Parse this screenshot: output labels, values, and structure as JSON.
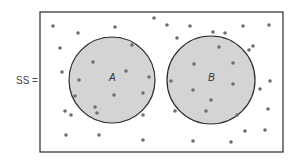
{
  "label": "SS =",
  "sets": [
    {
      "name": "A",
      "cx": 112,
      "cy": 80,
      "r": 43
    },
    {
      "name": "B",
      "cx": 211,
      "cy": 80,
      "r": 44
    }
  ],
  "universe": {
    "x": 40,
    "y": 12,
    "width": 243,
    "height": 140
  },
  "colors": {
    "set_fill": "#d4d4d4",
    "stroke": "#2a2a2a",
    "dot": "#6e6e6e",
    "text": "#444444"
  },
  "points": [
    [
      53,
      26
    ],
    [
      78,
      33
    ],
    [
      115,
      27
    ],
    [
      60,
      48
    ],
    [
      62,
      72
    ],
    [
      79,
      80
    ],
    [
      93,
      62
    ],
    [
      126,
      71
    ],
    [
      75,
      96
    ],
    [
      114,
      95
    ],
    [
      95,
      107
    ],
    [
      97,
      113
    ],
    [
      65,
      111
    ],
    [
      71,
      115
    ],
    [
      66,
      135
    ],
    [
      99,
      135
    ],
    [
      132,
      45
    ],
    [
      149,
      77
    ],
    [
      143,
      93
    ],
    [
      143,
      115
    ],
    [
      143,
      140
    ],
    [
      154,
      18
    ],
    [
      167,
      25
    ],
    [
      190,
      26
    ],
    [
      177,
      38
    ],
    [
      213,
      32
    ],
    [
      225,
      33
    ],
    [
      243,
      26
    ],
    [
      269,
      25
    ],
    [
      219,
      47
    ],
    [
      253,
      46
    ],
    [
      249,
      50
    ],
    [
      194,
      64
    ],
    [
      233,
      63
    ],
    [
      171,
      81
    ],
    [
      193,
      90
    ],
    [
      233,
      84
    ],
    [
      270,
      81
    ],
    [
      260,
      89
    ],
    [
      211,
      100
    ],
    [
      206,
      111
    ],
    [
      175,
      111
    ],
    [
      237,
      115
    ],
    [
      268,
      109
    ],
    [
      245,
      131
    ],
    [
      265,
      130
    ],
    [
      193,
      141
    ],
    [
      231,
      142
    ]
  ]
}
